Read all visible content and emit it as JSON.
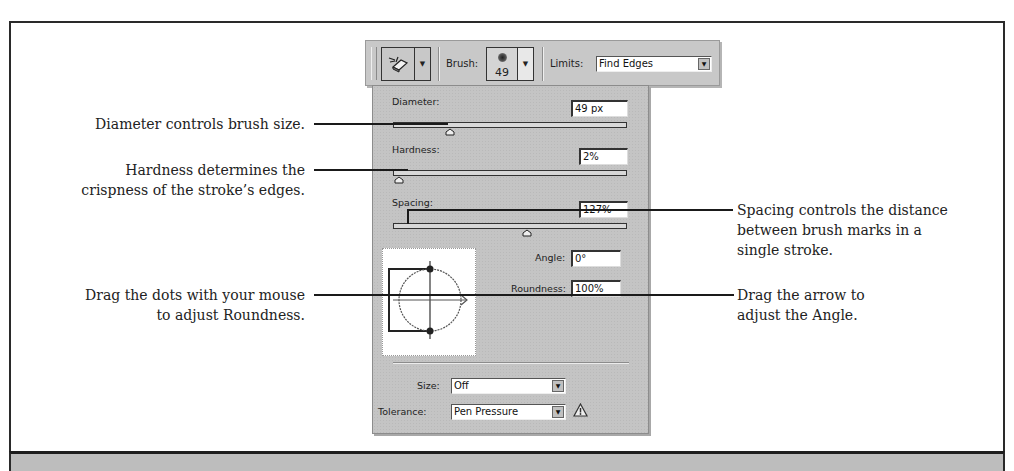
{
  "toolbar": {
    "tool_icon": "background-eraser-icon",
    "brush_label": "Brush:",
    "brush_size": "49",
    "limits_label": "Limits:",
    "limits_value": "Find Edges"
  },
  "panel": {
    "diameter": {
      "label": "Diameter:",
      "value": "49 px",
      "slider_pos": 0.24
    },
    "hardness": {
      "label": "Hardness:",
      "value": "2%",
      "slider_pos": 0.02
    },
    "spacing": {
      "label": "Spacing:",
      "value": "127%",
      "slider_pos": 0.57
    },
    "angle": {
      "label": "Angle:",
      "value": "0°"
    },
    "roundness": {
      "label": "Roundness:",
      "value": "100%"
    },
    "size": {
      "label": "Size:",
      "value": "Off"
    },
    "tolerance": {
      "label": "Tolerance:",
      "value": "Pen Pressure",
      "warning_icon": "warning-triangle-icon"
    }
  },
  "captions": {
    "diameter": "Diameter controls brush size.",
    "hardness_1": "Hardness determines the",
    "hardness_2": "crispness of the stroke’s edges.",
    "dots_1": "Drag the dots with your mouse",
    "dots_2": "to adjust Roundness.",
    "spacing_1": "Spacing controls the distance",
    "spacing_2": "between brush marks in a",
    "spacing_3": "single stroke.",
    "angle_1": "Drag the arrow to",
    "angle_2": "adjust the Angle."
  }
}
